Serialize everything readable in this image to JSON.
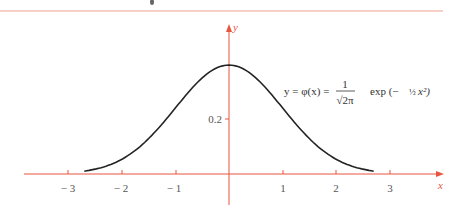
{
  "chart_data": {
    "type": "line",
    "title": "",
    "xlabel": "x",
    "ylabel": "y",
    "annotation": "y = φ(x) = 1/√(2π) exp(−½x²)",
    "x_ticks": [
      -3,
      -2,
      -1,
      1,
      2,
      3
    ],
    "x_tick_labels": [
      "− 3",
      "− 2",
      "− 1",
      "1",
      "2",
      "3"
    ],
    "y_ticks": [
      0.2
    ],
    "y_tick_labels": [
      "0.2"
    ],
    "xlim": [
      -3.7,
      4.2
    ],
    "ylim": [
      0,
      0.45
    ],
    "grid": false,
    "legend": "none",
    "series": [
      {
        "name": "standard normal density",
        "x": [
          -2.7,
          -2.5,
          -2.0,
          -1.5,
          -1.0,
          -0.5,
          0,
          0.5,
          1.0,
          1.5,
          2.0,
          2.5,
          2.7
        ],
        "values": [
          0.0104,
          0.0175,
          0.054,
          0.1295,
          0.242,
          0.3521,
          0.3989,
          0.3521,
          0.242,
          0.1295,
          0.054,
          0.0175,
          0.0104
        ]
      }
    ],
    "colors": {
      "axes": "#e8553f",
      "curve": "#222222",
      "top_rule": "#f0a090"
    }
  },
  "labels": {
    "x_axis": "x",
    "y_axis": "y",
    "tick_m3": "− 3",
    "tick_m2": "− 2",
    "tick_m1": "− 1",
    "tick_1": "1",
    "tick_2": "2",
    "tick_3": "3",
    "tick_y02": "0.2",
    "formula_lhs": "y  =  φ(x)  =",
    "formula_num": "1",
    "formula_den": "√2π",
    "formula_rhs": "exp (−",
    "formula_half": "½",
    "formula_end": "x²)"
  }
}
